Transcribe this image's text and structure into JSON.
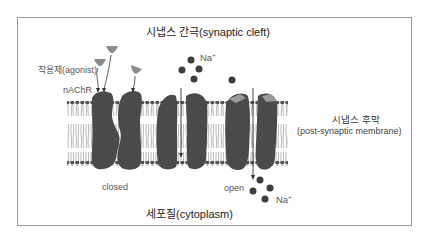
{
  "diagram": {
    "title_top": "시냅스 간극(synaptic cleft)",
    "title_bottom": "세포질(cytoplasm)",
    "labels": {
      "agonist": "작용제(agonist)",
      "receptor": "nAChR",
      "sodium_top": "Na",
      "sodium_top_charge": "+",
      "sodium_bottom": "Na",
      "sodium_bottom_charge": "+",
      "membrane_ko": "시냅스 후막",
      "membrane_en": "(post-synaptic membrane)",
      "state_closed": "closed",
      "state_open": "open"
    },
    "colors": {
      "protein": "#4a4a4a",
      "ion": "#3d3d3d",
      "lipid_head": "#555555",
      "lipid_tail": "#8a8a8a",
      "agonist": "#8c8c8c",
      "bound_agonist": "#9a9a9a",
      "frame_border": "#9a9a9a",
      "arrow": "#333333"
    }
  }
}
